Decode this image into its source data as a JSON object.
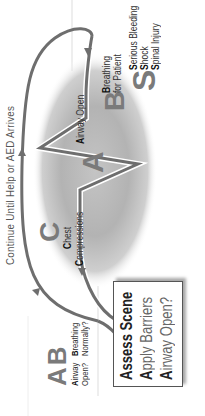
{
  "title": "Continue Until Help or AED Arrives",
  "cycle": {
    "C": {
      "letter": "C",
      "line1": "Chest",
      "line2": "Compressions",
      "initial1": "C",
      "rest1": "hest",
      "initial2": "C",
      "rest2": "ompressions"
    },
    "A": {
      "letter": "A",
      "initial": "A",
      "rest": "irway Open"
    },
    "B": {
      "letter": "B",
      "initial1": "B",
      "rest1": "reathing",
      "line2": "for Patient"
    }
  },
  "checks": {
    "A": {
      "letter": "A",
      "initial": "A",
      "rest": "irway",
      "line2": "Open?"
    },
    "B": {
      "letter": "B",
      "initial": "B",
      "rest": "reathing",
      "line2": "Normally?"
    }
  },
  "assess_box": {
    "lines": [
      {
        "initial": "A",
        "rest": "ssess Scene"
      },
      {
        "initial": "A",
        "rest": "pply Barriers"
      },
      {
        "initial": "A",
        "rest": "irway Open?"
      }
    ]
  },
  "s_section": {
    "letter": "S",
    "items": [
      {
        "initial": "S",
        "rest": "erious Bleeding"
      },
      {
        "initial": "S",
        "rest": "hock"
      },
      {
        "initial": "S",
        "rest": "pinal Injury"
      }
    ]
  },
  "colors": {
    "loop": "#6e6e6e",
    "ellipse_center": "#cfcfcf",
    "ellipse_edge": "#9a9a9a",
    "letters": "#7a7a7a"
  }
}
